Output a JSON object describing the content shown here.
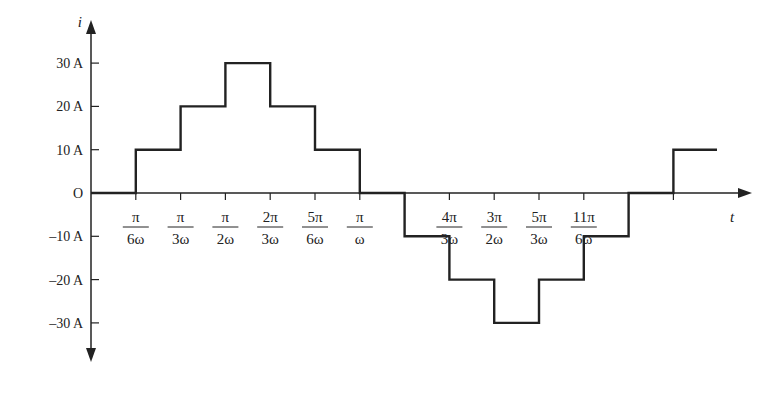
{
  "chart_data": {
    "type": "line",
    "subtype": "step",
    "title": "",
    "xlabel": "t",
    "ylabel": "i",
    "y_ticks": [
      "30 A",
      "20 A",
      "10 A",
      "O",
      "-10 A",
      "-20 A",
      "-30 A"
    ],
    "y_tick_values": [
      30,
      20,
      10,
      0,
      -10,
      -20,
      -30
    ],
    "x_ticks": [
      {
        "num": "π",
        "den": "6ω"
      },
      {
        "num": "π",
        "den": "3ω"
      },
      {
        "num": "π",
        "den": "2ω"
      },
      {
        "num": "2π",
        "den": "3ω"
      },
      {
        "num": "5π",
        "den": "6ω"
      },
      {
        "num": "π",
        "den": "ω"
      },
      {
        "num": "4π",
        "den": "3ω"
      },
      {
        "num": "3π",
        "den": "2ω"
      },
      {
        "num": "5π",
        "den": "3ω"
      },
      {
        "num": "11π",
        "den": "6ω"
      }
    ],
    "x_units": "π/(6ω)",
    "x": [
      0,
      1,
      2,
      3,
      4,
      5,
      6,
      7,
      8,
      9,
      10,
      11,
      12,
      13
    ],
    "values": [
      0,
      10,
      20,
      30,
      20,
      10,
      0,
      -10,
      -20,
      -30,
      -20,
      -10,
      0,
      10
    ],
    "ylim": [
      -30,
      30
    ],
    "grid": false,
    "legend": null
  }
}
